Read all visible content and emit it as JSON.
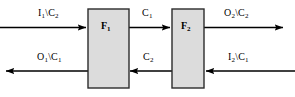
{
  "diagram": {
    "background_color": "#ffffff",
    "line_color": "#000000",
    "box_fill_color": "#dcdcdc",
    "box_border_color": "#2b2b2b",
    "blocks": [
      {
        "id": "f1",
        "label_main": "F",
        "label_sub": "1",
        "x": 88,
        "y": 9,
        "width": 41,
        "height": 79
      },
      {
        "id": "f2",
        "label_main": "F",
        "label_sub": "2",
        "x": 172,
        "y": 9,
        "width": 32,
        "height": 79
      }
    ],
    "signals": [
      {
        "id": "input-1",
        "label_main": "I",
        "label_sub": "1",
        "label_tail": "\\C",
        "label_tail_sub": "2",
        "direction": "right",
        "row": "top",
        "from": "external-left",
        "to": "f1"
      },
      {
        "id": "inter-c1",
        "label_main": "C",
        "label_sub": "1",
        "label_tail": "",
        "label_tail_sub": "",
        "direction": "right",
        "row": "top",
        "from": "f1",
        "to": "f2"
      },
      {
        "id": "output-2",
        "label_main": "O",
        "label_sub": "2",
        "label_tail": "\\C",
        "label_tail_sub": "2",
        "direction": "right",
        "row": "top",
        "from": "f2",
        "to": "external-right"
      },
      {
        "id": "output-1",
        "label_main": "O",
        "label_sub": "1",
        "label_tail": "\\C",
        "label_tail_sub": "1",
        "direction": "left",
        "row": "bottom",
        "from": "f1",
        "to": "external-left"
      },
      {
        "id": "inter-c2",
        "label_main": "C",
        "label_sub": "2",
        "label_tail": "",
        "label_tail_sub": "",
        "direction": "left",
        "row": "bottom",
        "from": "f2",
        "to": "f1"
      },
      {
        "id": "input-2",
        "label_main": "I",
        "label_sub": "2",
        "label_tail": "\\C",
        "label_tail_sub": "1",
        "direction": "left",
        "row": "bottom",
        "from": "external-right",
        "to": "f2"
      }
    ]
  }
}
